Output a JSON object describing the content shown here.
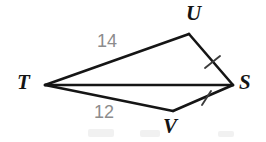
{
  "figure": {
    "background_color": "#ffffff",
    "stroke_color": "#151515",
    "label_color": "#141414",
    "measure_color": "#8c8c8c",
    "tick_color": "#3c3c3c",
    "width": 266,
    "height": 142
  },
  "vertices": [
    {
      "name": "T",
      "label": "T",
      "x": 45,
      "y": 85,
      "label_x": 17,
      "label_y": 72
    },
    {
      "name": "U",
      "label": "U",
      "x": 189,
      "y": 34,
      "label_x": 186,
      "label_y": 3
    },
    {
      "name": "S",
      "label": "S",
      "x": 233,
      "y": 85,
      "label_x": 239,
      "label_y": 72
    },
    {
      "name": "V",
      "label": "V",
      "x": 173,
      "y": 111,
      "label_x": 163,
      "label_y": 116
    }
  ],
  "segments": [
    {
      "name": "TU",
      "from": "T",
      "to": "U",
      "x1": 45,
      "y1": 85,
      "x2": 189,
      "y2": 34,
      "measure": "14",
      "ticks": 0
    },
    {
      "name": "US",
      "from": "U",
      "to": "S",
      "x1": 189,
      "y1": 34,
      "x2": 233,
      "y2": 85,
      "measure": "",
      "ticks": 1
    },
    {
      "name": "TS",
      "from": "T",
      "to": "S",
      "x1": 45,
      "y1": 85,
      "x2": 233,
      "y2": 85,
      "measure": "",
      "ticks": 0
    },
    {
      "name": "TV",
      "from": "T",
      "to": "V",
      "x1": 45,
      "y1": 85,
      "x2": 173,
      "y2": 111,
      "measure": "12",
      "ticks": 0
    },
    {
      "name": "VS",
      "from": "V",
      "to": "S",
      "x1": 173,
      "y1": 111,
      "x2": 233,
      "y2": 85,
      "measure": "",
      "ticks": 1
    }
  ],
  "side_measures": [
    {
      "name": "TU-measure",
      "value": "14",
      "segment": "TU",
      "x": 97,
      "y": 32
    },
    {
      "name": "TV-measure",
      "value": "12",
      "segment": "TV",
      "x": 94,
      "y": 103
    }
  ],
  "tick_marks": [
    {
      "name": "US-tick",
      "segment": "US",
      "x": 212,
      "y": 62
    },
    {
      "name": "VS-tick",
      "segment": "VS",
      "x": 206,
      "y": 98
    }
  ]
}
